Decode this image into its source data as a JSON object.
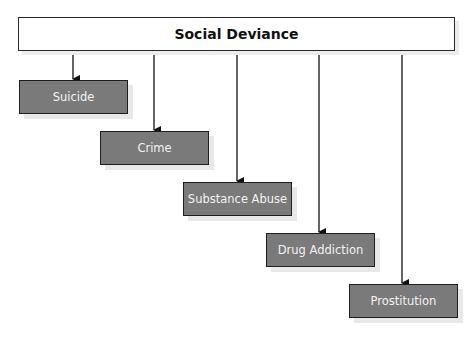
{
  "diagram": {
    "type": "hierarchy",
    "root": {
      "label": "Social Deviance"
    },
    "children": [
      {
        "label": "Suicide"
      },
      {
        "label": "Crime"
      },
      {
        "label": "Substance Abuse"
      },
      {
        "label": "Drug Addiction"
      },
      {
        "label": "Prostitution"
      }
    ]
  },
  "colors": {
    "root_fill": "#ffffff",
    "child_fill": "#7a7a7a",
    "child_text": "#f2f2f2",
    "border": "#1e1e1e"
  }
}
